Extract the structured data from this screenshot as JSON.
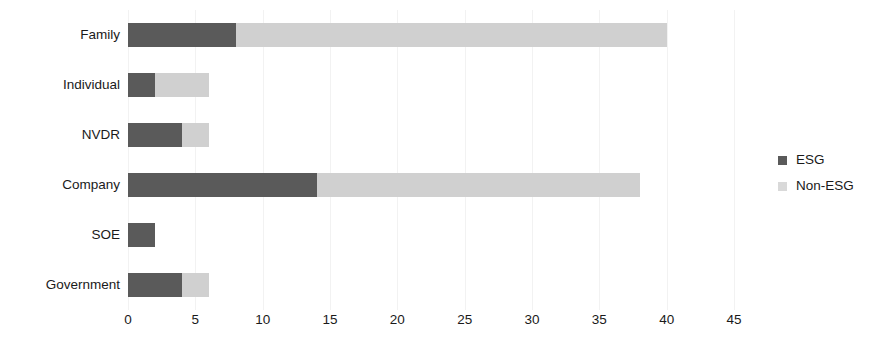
{
  "chart_data": {
    "type": "bar",
    "orientation": "horizontal",
    "stacked": true,
    "title": "",
    "xlabel": "",
    "ylabel": "",
    "categories": [
      "Family",
      "Individual",
      "NVDR",
      "Company",
      "SOE",
      "Government"
    ],
    "series": [
      {
        "name": "ESG",
        "color": "#5a5a5a",
        "values": [
          8,
          2,
          4,
          14,
          2,
          4
        ]
      },
      {
        "name": "Non-ESG",
        "color": "#d0d0d0",
        "values": [
          32,
          4,
          2,
          24,
          0,
          2
        ]
      }
    ],
    "totals": [
      40,
      6,
      6,
      38,
      2,
      6
    ],
    "xlim": [
      0,
      45
    ],
    "xticks": [
      0,
      5,
      10,
      15,
      20,
      25,
      30,
      35,
      40,
      45
    ],
    "xtick_labels": [
      "0",
      "5",
      "10",
      "15",
      "20",
      "25",
      "30",
      "35",
      "40",
      "45"
    ],
    "grid": true,
    "grid_axis": "x",
    "grid_color": "#f2f2f2",
    "legend_position": "right",
    "legend": [
      {
        "label": "ESG",
        "color": "#5a5a5a"
      },
      {
        "label": "Non-ESG",
        "color": "#d9d9d9"
      }
    ],
    "background": "#ffffff"
  }
}
